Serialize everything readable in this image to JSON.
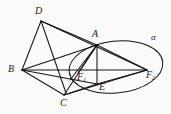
{
  "figure": {
    "stroke_color": "#141414",
    "background_color": "#fbfbfa",
    "labels": {
      "d": "D",
      "a": "A",
      "b": "B",
      "c": "C",
      "e": "E",
      "f1": "F",
      "f1_sub": "1",
      "f2": "F",
      "f2_sub": "2",
      "alpha": "α"
    },
    "points": {
      "D": [
        41,
        21
      ],
      "A": [
        97,
        45
      ],
      "B": [
        22,
        70
      ],
      "C": [
        64,
        95
      ],
      "E": [
        97,
        84
      ],
      "F1": [
        78,
        73
      ],
      "F2": [
        147,
        70
      ]
    },
    "ellipse": {
      "center": [
        116,
        67
      ],
      "rx": 47,
      "ry": 26,
      "rotation_deg": -6
    },
    "segments": [
      [
        "D",
        "A"
      ],
      [
        "D",
        "B"
      ],
      [
        "D",
        "F1"
      ],
      [
        "D",
        "F2"
      ],
      [
        "B",
        "A"
      ],
      [
        "B",
        "C"
      ],
      [
        "B",
        "F2"
      ],
      [
        "A",
        "C"
      ],
      [
        "A",
        "E"
      ],
      [
        "A",
        "F1"
      ],
      [
        "A",
        "F2"
      ],
      [
        "C",
        "E"
      ],
      [
        "C",
        "F2"
      ],
      [
        "E",
        "F2"
      ],
      [
        "F1",
        "A"
      ]
    ]
  }
}
